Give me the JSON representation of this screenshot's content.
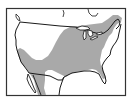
{
  "map": {
    "title": "",
    "subject": "species range map",
    "region": "North America (contiguous United States, southern Canada, northern Mexico)",
    "features": [
      {
        "name": "range",
        "description": "shaded distribution range covering eastern and central US, extending into southern Canada along the northeast and south into Mexico; excludes the northwest/west and the northern Great Plains interior"
      },
      {
        "name": "country-borders",
        "description": "US–Canada and US–Mexico borders plus coastline outlined in black"
      },
      {
        "name": "great-lakes",
        "description": "Great Lakes shown in white with outline"
      },
      {
        "name": "baja-california",
        "description": "Baja California peninsula outlined"
      },
      {
        "name": "florida",
        "description": "Florida peninsula outlined"
      }
    ],
    "colors": {
      "range": "#a9a9a9",
      "land": "#ffffff",
      "water": "#ffffff",
      "outline": "#1a1a1a",
      "frame": "#333333",
      "background": "#ffffff"
    },
    "legend": []
  }
}
